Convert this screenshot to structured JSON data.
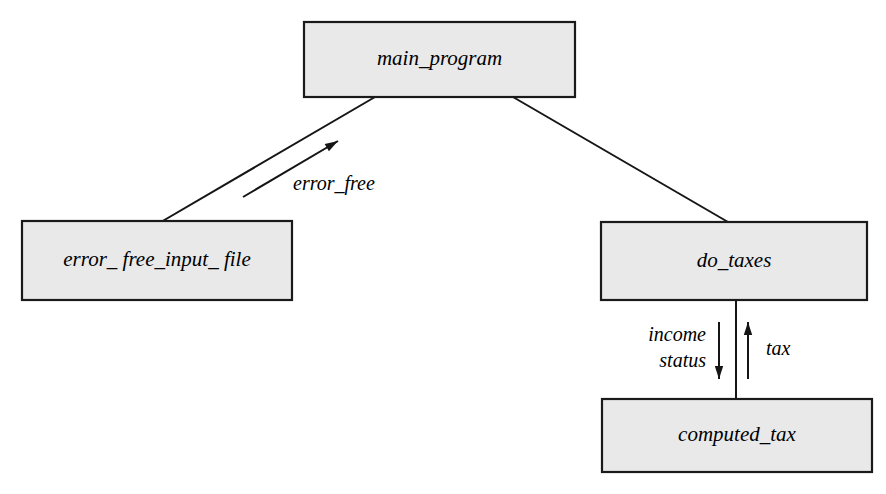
{
  "diagram": {
    "type": "structure-chart",
    "background_color": "#ffffff",
    "box_fill_color": "#e9e9e9",
    "box_border_color": "#1a1a1a",
    "line_color": "#151515",
    "nodes": [
      {
        "id": "main_program",
        "label": "main_program",
        "x": 304,
        "y": 22,
        "width": 271,
        "height": 75
      },
      {
        "id": "error_free_input_file",
        "label": "error_ free_input_ file",
        "x": 22,
        "y": 221,
        "width": 270,
        "height": 79
      },
      {
        "id": "do_taxes",
        "label": "do_taxes",
        "x": 601,
        "y": 222,
        "width": 266,
        "height": 78
      },
      {
        "id": "computed_tax",
        "label": "computed_tax",
        "x": 602,
        "y": 399,
        "width": 270,
        "height": 73
      }
    ],
    "edges": [
      {
        "id": "main-to-error-file",
        "from": "main_program",
        "to": "error_free_input_file",
        "kind": "plain-line",
        "x1": 375,
        "y1": 97,
        "x2": 161,
        "y2": 222
      },
      {
        "id": "main-to-do-taxes",
        "from": "main_program",
        "to": "do_taxes",
        "kind": "plain-line",
        "x1": 513,
        "y1": 97,
        "x2": 728,
        "y2": 222
      },
      {
        "id": "do-taxes-to-computed-tax",
        "from": "do_taxes",
        "to": "computed_tax",
        "kind": "plain-line",
        "x1": 736,
        "y1": 300,
        "x2": 736,
        "y2": 399
      }
    ],
    "data_flow_arrows": [
      {
        "id": "error-free-flow",
        "label": "error_free",
        "direction": "up-right",
        "x1": 243,
        "y1": 197,
        "x2": 338,
        "y2": 141,
        "label_x": 293,
        "label_y": 190,
        "label_anchor": "start"
      },
      {
        "id": "income-status-flow",
        "label_lines": [
          "income",
          "status"
        ],
        "direction": "down",
        "x1": 719,
        "y1": 322,
        "x2": 719,
        "y2": 379,
        "label_x": 706,
        "label_y": 341,
        "label_anchor": "end",
        "label_line_height": 26
      },
      {
        "id": "tax-flow",
        "label": "tax",
        "direction": "up",
        "x1": 748,
        "y1": 379,
        "x2": 748,
        "y2": 322,
        "label_x": 766,
        "label_y": 355,
        "label_anchor": "start"
      }
    ]
  }
}
